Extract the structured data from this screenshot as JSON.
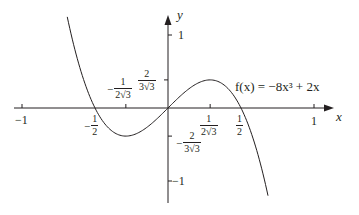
{
  "chart_data": {
    "type": "line",
    "title": "",
    "function_label": "f(x) = −8x³ + 2x",
    "expression": {
      "coeff_cubic": -8,
      "coeff_linear": 2
    },
    "xlabel": "x",
    "ylabel": "y",
    "xlim": [
      -1.0,
      1.25
    ],
    "ylim": [
      -1.25,
      1.35
    ],
    "x_domain_plotted": [
      -0.69,
      0.685
    ],
    "grid": false,
    "legend": "none",
    "x_ticks": [
      {
        "value": -1,
        "label": "−1"
      },
      {
        "value": -0.5,
        "label": "−½"
      },
      {
        "value": -0.2887,
        "label": "−1/(2√3)"
      },
      {
        "value": 0.2887,
        "label": "1/(2√3)"
      },
      {
        "value": 0.5,
        "label": "½"
      },
      {
        "value": 1,
        "label": "1"
      }
    ],
    "y_ticks": [
      {
        "value": 1,
        "label": "1"
      },
      {
        "value": 0.3849,
        "label": "2/(3√3)"
      },
      {
        "value": -0.3849,
        "label": "−2/(3√3)"
      },
      {
        "value": -1,
        "label": "−1"
      }
    ],
    "key_points": [
      {
        "name": "root-left",
        "x": -0.5,
        "y": 0
      },
      {
        "name": "origin",
        "x": 0,
        "y": 0
      },
      {
        "name": "root-right",
        "x": 0.5,
        "y": 0
      },
      {
        "name": "local-min",
        "x": -0.2887,
        "y": -0.3849
      },
      {
        "name": "local-max",
        "x": 0.2887,
        "y": 0.3849
      }
    ]
  },
  "labels": {
    "axis_x": "x",
    "axis_y": "y",
    "x_neg1": "−1",
    "x_1": "1",
    "y_1": "1",
    "y_neg1": "−1",
    "half_num": "1",
    "half_den": "2",
    "minus": "−",
    "frac_1": "1",
    "frac_2": "2",
    "den_2r3": "2√3",
    "den_3r3": "3√3",
    "function_label": "f(x) = −8x³ + 2x"
  },
  "style": {
    "line_color": "#231f20",
    "axis_color": "#231f20"
  }
}
